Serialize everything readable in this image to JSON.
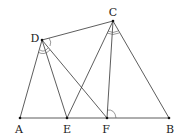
{
  "diagram": {
    "points": [
      {
        "name": "A",
        "x": 20,
        "y": 118,
        "lx": 19,
        "ly": 133
      },
      {
        "name": "E",
        "x": 67,
        "y": 118,
        "lx": 67,
        "ly": 133
      },
      {
        "name": "F",
        "x": 107,
        "y": 118,
        "lx": 106,
        "ly": 133
      },
      {
        "name": "B",
        "x": 169,
        "y": 118,
        "lx": 170,
        "ly": 133
      },
      {
        "name": "D",
        "x": 42,
        "y": 40,
        "lx": 35,
        "ly": 40
      },
      {
        "name": "C",
        "x": 113,
        "y": 21,
        "lx": 113,
        "ly": 15
      }
    ],
    "segments": [
      [
        "A",
        "B"
      ],
      [
        "A",
        "D"
      ],
      [
        "D",
        "E"
      ],
      [
        "D",
        "F"
      ],
      [
        "D",
        "C"
      ],
      [
        "C",
        "E"
      ],
      [
        "C",
        "F"
      ],
      [
        "C",
        "B"
      ]
    ],
    "angle_marks": [
      {
        "at": "D",
        "type": "double-arc"
      },
      {
        "at": "C",
        "type": "double-arc"
      },
      {
        "at": "F",
        "type": "single-arc"
      }
    ]
  }
}
